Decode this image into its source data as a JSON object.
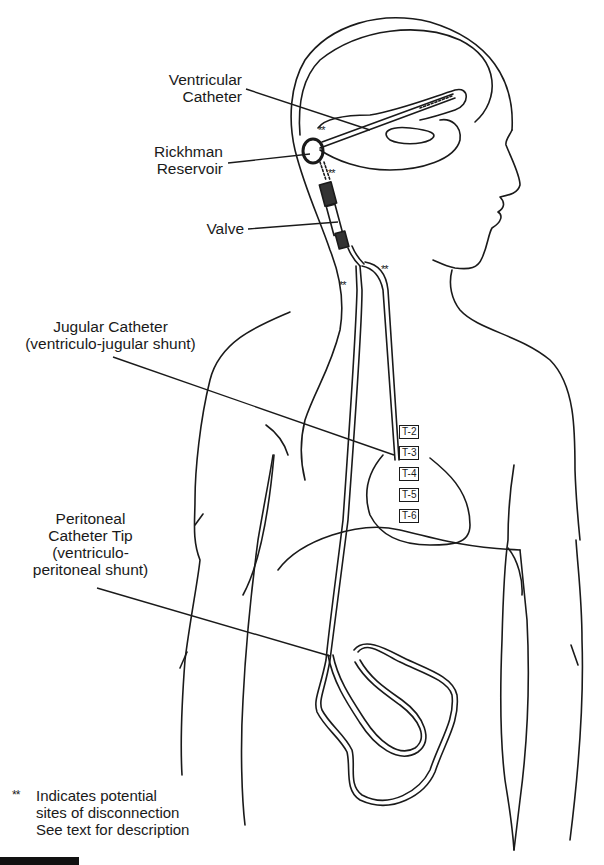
{
  "diagram": {
    "labels": {
      "ventricular_catheter": [
        "Ventricular",
        "Catheter"
      ],
      "rickhman_reservoir": [
        "Rickhman",
        "Reservoir"
      ],
      "valve": "Valve",
      "jugular_catheter": [
        "Jugular Catheter",
        "(ventriculo-jugular shunt)"
      ],
      "peritoneal_catheter": [
        "Peritoneal",
        "Catheter Tip",
        "(ventriculo-",
        "peritoneal shunt)"
      ]
    },
    "vertebrae": [
      "T-2",
      "T-3",
      "T-4",
      "T-5",
      "T-6"
    ],
    "disconnection_marker": "**",
    "legend": {
      "marker": "**",
      "lines": [
        "Indicates potential",
        "sites of disconnection",
        "See text for description"
      ]
    },
    "colors": {
      "line": "#1a1a1a",
      "background": "#ffffff"
    }
  }
}
